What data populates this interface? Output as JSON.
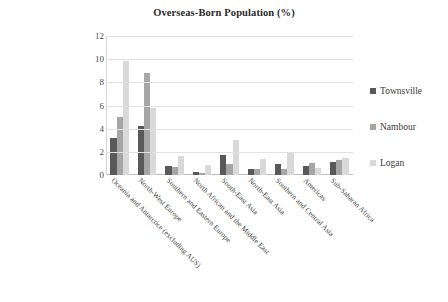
{
  "chart_data": {
    "type": "bar",
    "title": "Overseas-Born Population (%)",
    "xlabel": "",
    "ylabel": "",
    "ylim": [
      0,
      12
    ],
    "yticks": [
      0,
      2,
      4,
      6,
      8,
      10,
      12
    ],
    "grid": true,
    "legend_position": "right",
    "categories": [
      "Oceania and Antarctice (excluding AUS)",
      "North-West Europe",
      "Southern and Eastern Europe",
      "North African and the Middle East",
      "South-East Asia",
      "North-East Asia",
      "Southern and Central Asia",
      "Americas",
      "Sub-Saharan Africa"
    ],
    "series": [
      {
        "name": "Townsville",
        "color": "#595959",
        "values": [
          3.2,
          4.2,
          0.75,
          0.25,
          1.7,
          0.55,
          0.95,
          0.75,
          1.15
        ]
      },
      {
        "name": "Nambour",
        "color": "#a6a6a6",
        "values": [
          5.0,
          8.8,
          0.7,
          0.15,
          0.95,
          0.5,
          0.55,
          1.0,
          1.3
        ]
      },
      {
        "name": "Logan",
        "color": "#d9d9d9",
        "values": [
          9.8,
          5.8,
          1.65,
          0.85,
          3.0,
          1.4,
          1.9,
          0.6,
          1.5
        ]
      }
    ]
  }
}
